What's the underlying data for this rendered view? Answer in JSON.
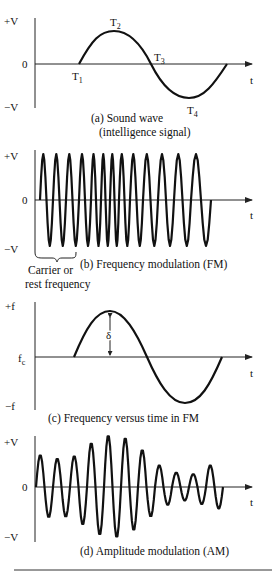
{
  "figure": {
    "panels": [
      {
        "id": "a",
        "y_labels": {
          "top": "+V",
          "mid": "0",
          "bottom": "−V"
        },
        "x_label": "t",
        "points": {
          "t1": "T",
          "t2": "T",
          "t3": "T",
          "t4": "T",
          "sub1": "1",
          "sub2": "2",
          "sub3": "3",
          "sub4": "4"
        },
        "caption_line1": "(a) Sound wave",
        "caption_line2": "(intelligence signal)"
      },
      {
        "id": "b",
        "y_labels": {
          "top": "+V",
          "mid": "0",
          "bottom": "−V"
        },
        "x_label": "t",
        "brace_label_line1": "Carrier or",
        "brace_label_line2": "rest frequency",
        "caption": "(b) Frequency modulation (FM)"
      },
      {
        "id": "c",
        "y_labels": {
          "top": "+f",
          "mid": "f",
          "mid_sub": "c",
          "bottom": "−f"
        },
        "x_label": "t",
        "deviation_label": "δ",
        "caption": "(c) Frequency versus time in FM"
      },
      {
        "id": "d",
        "y_labels": {
          "top": "+V",
          "mid": "0",
          "bottom": "−V"
        },
        "x_label": "t",
        "caption": "(d) Amplitude modulation (AM)"
      }
    ]
  },
  "chart_data": [
    {
      "type": "line",
      "title": "(a) Sound wave (intelligence signal)",
      "xlabel": "t",
      "ylabel": "V",
      "y_ticks": [
        "+V",
        "0",
        "−V"
      ],
      "annotations": [
        "T1 (start, 0)",
        "T2 (positive peak)",
        "T3 (zero crossing)",
        "T4 (negative peak)"
      ],
      "series": [
        {
          "name": "sound wave",
          "shape": "one full sine cycle",
          "x": [
            0,
            0.25,
            0.5,
            0.75,
            1.0
          ],
          "y": [
            0,
            1,
            0,
            -1,
            0
          ]
        }
      ]
    },
    {
      "type": "line",
      "title": "(b) Frequency modulation (FM)",
      "xlabel": "t",
      "ylabel": "V",
      "y_ticks": [
        "+V",
        "0",
        "−V"
      ],
      "annotations": [
        "Carrier or rest frequency"
      ],
      "series": [
        {
          "name": "FM carrier",
          "amplitude": 1,
          "cycles": 13,
          "note": "constant amplitude; frequency increases then decreases following modulating signal"
        }
      ]
    },
    {
      "type": "line",
      "title": "(c) Frequency versus time in FM",
      "xlabel": "t",
      "ylabel": "f",
      "y_ticks": [
        "+f",
        "fc",
        "−f"
      ],
      "annotations": [
        "δ (deviation from fc to peak)"
      ],
      "series": [
        {
          "name": "instantaneous frequency",
          "shape": "one full sine cycle",
          "x": [
            0,
            0.25,
            0.5,
            0.75,
            1.0
          ],
          "y": [
            0,
            1,
            0,
            -1,
            0
          ]
        }
      ]
    },
    {
      "type": "line",
      "title": "(d) Amplitude modulation (AM)",
      "xlabel": "t",
      "ylabel": "V",
      "y_ticks": [
        "+V",
        "0",
        "−V"
      ],
      "series": [
        {
          "name": "AM carrier",
          "cycles": 11,
          "peak_amplitudes": [
            0.62,
            0.55,
            0.6,
            0.85,
            1.0,
            0.95,
            0.72,
            0.42,
            0.28,
            0.25,
            0.42
          ]
        }
      ]
    }
  ]
}
